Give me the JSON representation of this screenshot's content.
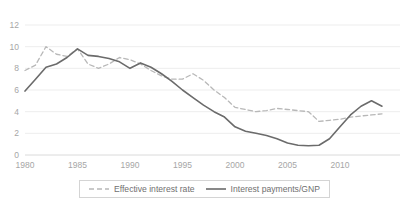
{
  "chart_data": {
    "type": "line",
    "title": "",
    "xlabel": "",
    "ylabel": "",
    "xlim": [
      1980,
      2014
    ],
    "ylim": [
      0,
      12
    ],
    "grid": true,
    "legend_position": "bottom",
    "x_ticks": [
      "1980",
      "1985",
      "1990",
      "1995",
      "2000",
      "2005",
      "2010"
    ],
    "x_tick_values": [
      1980,
      1985,
      1990,
      1995,
      2000,
      2005,
      2010
    ],
    "y_ticks": [
      "0",
      "2",
      "4",
      "6",
      "8",
      "10",
      "12"
    ],
    "y_tick_values": [
      0,
      2,
      4,
      6,
      8,
      10,
      12
    ],
    "x": [
      1980,
      1981,
      1982,
      1983,
      1984,
      1985,
      1986,
      1987,
      1988,
      1989,
      1990,
      1991,
      1992,
      1993,
      1994,
      1995,
      1996,
      1997,
      1998,
      1999,
      2000,
      2001,
      2002,
      2003,
      2004,
      2005,
      2006,
      2007,
      2008,
      2009,
      2010,
      2011,
      2012,
      2013,
      2014
    ],
    "series": [
      {
        "name": "Effective interest rate",
        "style": "dashed",
        "color": "#b8b8b8",
        "values": [
          7.8,
          8.3,
          10.0,
          9.3,
          9.1,
          9.8,
          8.4,
          8.0,
          8.4,
          9.0,
          8.8,
          8.4,
          7.8,
          7.3,
          7.0,
          7.0,
          7.5,
          6.9,
          6.0,
          5.3,
          4.4,
          4.2,
          4.0,
          4.1,
          4.3,
          4.2,
          4.1,
          4.0,
          3.1,
          3.2,
          3.3,
          3.5,
          3.6,
          3.7,
          3.8
        ]
      },
      {
        "name": "Interest payments/GNP",
        "style": "solid",
        "color": "#6b6b6b",
        "values": [
          5.9,
          7.0,
          8.1,
          8.4,
          9.0,
          9.8,
          9.2,
          9.1,
          8.9,
          8.6,
          8.0,
          8.5,
          8.1,
          7.5,
          6.8,
          6.0,
          5.3,
          4.6,
          4.0,
          3.5,
          2.6,
          2.2,
          2.0,
          1.8,
          1.5,
          1.1,
          0.9,
          0.85,
          0.9,
          1.5,
          2.6,
          3.7,
          4.5,
          5.0,
          4.5
        ]
      }
    ]
  },
  "legend": {
    "items": [
      {
        "label": "Effective interest rate",
        "swatch": "dashed-line-swatch"
      },
      {
        "label": "Interest payments/GNP",
        "swatch": "solid-line-swatch"
      }
    ]
  },
  "colors": {
    "grid": "#e8e8e8",
    "axis": "#d0d0d0",
    "tick_text": "#a6a6a6",
    "legend_text": "#6f6f6f",
    "legend_border": "#d4d4d4",
    "series_dashed": "#b8b8b8",
    "series_solid": "#6b6b6b",
    "background": "#ffffff"
  }
}
